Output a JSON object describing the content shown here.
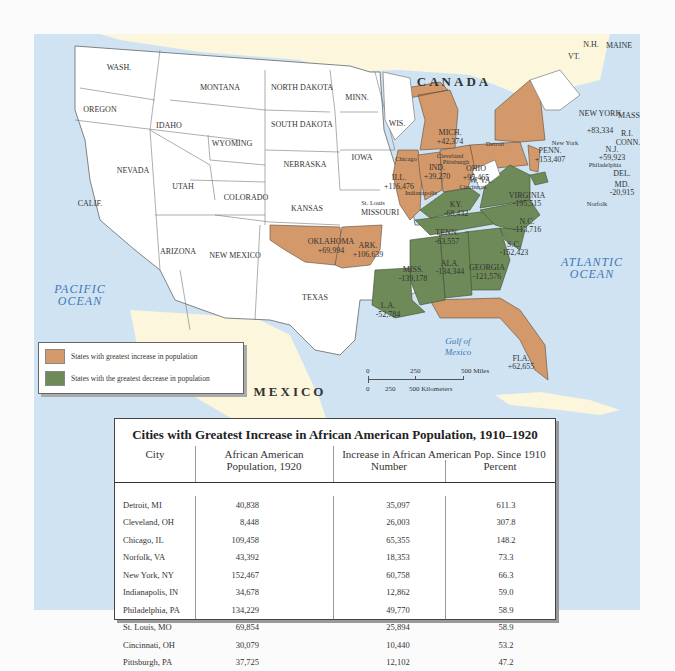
{
  "map": {
    "country_labels": {
      "canada": "CANADA",
      "mexico": "MEXICO"
    },
    "ocean_labels": {
      "pacific": [
        "PACIFIC",
        "OCEAN"
      ],
      "atlantic": [
        "ATLANTIC",
        "OCEAN"
      ],
      "gulf": [
        "Gulf of",
        "Mexico"
      ]
    },
    "colors": {
      "increase": "#d4996a",
      "decrease": "#6e8a58",
      "water": "#cfe3f3",
      "land_foreign": "#fbf6dc",
      "neutral": "#ffffff"
    },
    "states_neutral": [
      "WASH.",
      "OREGON",
      "CALIF.",
      "IDAHO",
      "NEVADA",
      "MONTANA",
      "WYOMING",
      "UTAH",
      "ARIZONA",
      "COLORADO",
      "NEW MEXICO",
      "NORTH DAKOTA",
      "SOUTH DAKOTA",
      "NEBRASKA",
      "KANSAS",
      "TEXAS",
      "MINN.",
      "IOWA",
      "MISSOURI",
      "WIS.",
      "W. VA.",
      "VT.",
      "N.H.",
      "MAINE",
      "MASS.",
      "R.I.",
      "CONN.",
      "DEL."
    ],
    "states_increase": [
      {
        "name": "OKLAHOMA",
        "value": "+69,994"
      },
      {
        "name": "ARK.",
        "value": "+106,639"
      },
      {
        "name": "ILL.",
        "value": "+116,476"
      },
      {
        "name": "IND.",
        "value": "+39,270"
      },
      {
        "name": "OHIO",
        "value": "+95,465"
      },
      {
        "name": "MICH.",
        "value": "+42,374"
      },
      {
        "name": "PENN.",
        "value": "+153,407"
      },
      {
        "name": "NEW YORK",
        "value": "+83,334"
      },
      {
        "name": "N.J.",
        "value": "+59,923"
      },
      {
        "name": "FLA.",
        "value": "+62,655"
      }
    ],
    "states_decrease": [
      {
        "name": "KY.",
        "value": "-68,432"
      },
      {
        "name": "TENN.",
        "value": "-63,557"
      },
      {
        "name": "VIRGINIA",
        "value": "-195,515"
      },
      {
        "name": "N.C.",
        "value": "-113,716"
      },
      {
        "name": "S.C.",
        "value": "-152,423"
      },
      {
        "name": "GEORGIA",
        "value": "-121,576"
      },
      {
        "name": "ALA.",
        "value": "-134,344"
      },
      {
        "name": "MISS.",
        "value": "-139,178"
      },
      {
        "name": "L.A.",
        "value": "-52,784"
      },
      {
        "name": "MD.",
        "value": "-20,915"
      }
    ],
    "cities": [
      "Chicago",
      "Detroit",
      "Cleveland",
      "Pittsburgh",
      "New York",
      "Philadelphia",
      "Indianapolis",
      "Cincinnati",
      "St. Louis",
      "Norfolk"
    ],
    "legend": {
      "increase": "States with greatest increase in population",
      "decrease": "States with the greatest decrease in population"
    },
    "scale": {
      "miles": [
        "0",
        "250",
        "500 Miles"
      ],
      "km": [
        "0",
        "250",
        "500 Kilometers"
      ]
    }
  },
  "table": {
    "title": "Cities with Greatest Increase in African American Population, 1910–1920",
    "headers": {
      "city": "City",
      "pop_1920": [
        "African American",
        "Population, 1920"
      ],
      "increase_group": "Increase in African American Pop. Since 1910",
      "number": "Number",
      "percent": "Percent"
    },
    "rows": [
      {
        "city": "Detroit, MI",
        "pop_1920": "40,838",
        "number": "35,097",
        "percent": "611.3"
      },
      {
        "city": "Cleveland, OH",
        "pop_1920": "8,448",
        "number": "26,003",
        "percent": "307.8"
      },
      {
        "city": "Chicago, IL",
        "pop_1920": "109,458",
        "number": "65,355",
        "percent": "148.2"
      },
      {
        "city": "Norfolk, VA",
        "pop_1920": "43,392",
        "number": "18,353",
        "percent": "73.3"
      },
      {
        "city": "New York, NY",
        "pop_1920": "152,467",
        "number": "60,758",
        "percent": "66.3"
      },
      {
        "city": "Indianapolis, IN",
        "pop_1920": "34,678",
        "number": "12,862",
        "percent": "59.0"
      },
      {
        "city": "Philadelphia, PA",
        "pop_1920": "134,229",
        "number": "49,770",
        "percent": "58.9"
      },
      {
        "city": "St. Louis, MO",
        "pop_1920": "69,854",
        "number": "25,894",
        "percent": "58.9"
      },
      {
        "city": "Cincinnati, OH",
        "pop_1920": "30,079",
        "number": "10,440",
        "percent": "53.2"
      },
      {
        "city": "Pittsburgh, PA",
        "pop_1920": "37,725",
        "number": "12,102",
        "percent": "47.2"
      }
    ]
  }
}
